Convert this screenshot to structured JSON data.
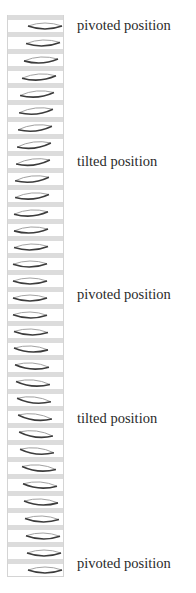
{
  "labels": [
    {
      "text": "pivoted position",
      "top": 18
    },
    {
      "text": "tilted position",
      "top": 154
    },
    {
      "text": "pivoted position",
      "top": 287
    },
    {
      "text": "tilted position",
      "top": 411
    },
    {
      "text": "pivoted position",
      "top": 556
    }
  ],
  "colors": {
    "band": "#dcdcdc",
    "border": "#d4d4d4",
    "lens_top": "#9a9a9a",
    "lens_bottom": "#3c3c3c"
  },
  "rows": [
    {
      "x": 19,
      "angle": 0
    },
    {
      "x": 17,
      "angle": -2
    },
    {
      "x": 15,
      "angle": -3
    },
    {
      "x": 13,
      "angle": -4
    },
    {
      "x": 11,
      "angle": -5
    },
    {
      "x": 10,
      "angle": -6
    },
    {
      "x": 9,
      "angle": -6
    },
    {
      "x": 8,
      "angle": -7
    },
    {
      "x": 7,
      "angle": -7
    },
    {
      "x": 6,
      "angle": -6
    },
    {
      "x": 6,
      "angle": -5
    },
    {
      "x": 5,
      "angle": -4
    },
    {
      "x": 5,
      "angle": -3
    },
    {
      "x": 5,
      "angle": -2
    },
    {
      "x": 4,
      "angle": -1
    },
    {
      "x": 4,
      "angle": 0
    },
    {
      "x": 4,
      "angle": 0
    },
    {
      "x": 4,
      "angle": 1
    },
    {
      "x": 5,
      "angle": 2
    },
    {
      "x": 5,
      "angle": 3
    },
    {
      "x": 6,
      "angle": 4
    },
    {
      "x": 7,
      "angle": 5
    },
    {
      "x": 8,
      "angle": 6
    },
    {
      "x": 9,
      "angle": 7
    },
    {
      "x": 10,
      "angle": 7
    },
    {
      "x": 11,
      "angle": 6
    },
    {
      "x": 13,
      "angle": 5
    },
    {
      "x": 14,
      "angle": 4
    },
    {
      "x": 15,
      "angle": 3
    },
    {
      "x": 16,
      "angle": 2
    },
    {
      "x": 17,
      "angle": 1
    },
    {
      "x": 18,
      "angle": 0
    },
    {
      "x": 19,
      "angle": 0
    }
  ]
}
